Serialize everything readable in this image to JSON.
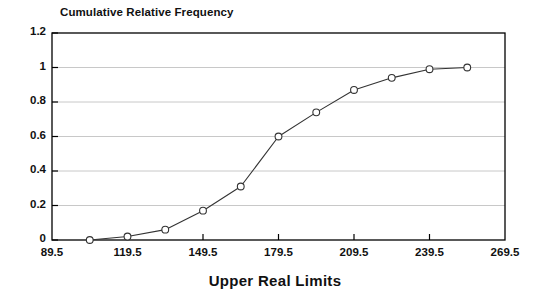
{
  "chart_data": {
    "type": "line",
    "title": "Cumulative Relative Frequency",
    "subtitle": "",
    "xlabel": "Upper Real Limits",
    "ylabel": "",
    "xlim": [
      89.5,
      269.5
    ],
    "ylim": [
      0,
      1.2
    ],
    "xticks": [
      89.5,
      119.5,
      149.5,
      179.5,
      209.5,
      239.5,
      269.5
    ],
    "xtick_labels": [
      "89.5",
      "119.5",
      "149.5",
      "179.5",
      "209.5",
      "239.5",
      "269.5"
    ],
    "yticks": [
      0,
      0.2,
      0.4,
      0.6,
      0.8,
      1,
      1.2
    ],
    "ytick_labels": [
      "0",
      "0.2",
      "0.4",
      "0.6",
      "0.8",
      "1",
      "1.2"
    ],
    "grid": "horizontal",
    "legend": "none",
    "marker": "open-circle",
    "line_color": "#333333",
    "grid_color": "#c8c8c8",
    "axis_color": "#000000",
    "x": [
      104.5,
      119.5,
      134.5,
      149.5,
      164.5,
      179.5,
      194.5,
      209.5,
      224.5,
      239.5,
      254.5
    ],
    "values": [
      0.0,
      0.02,
      0.06,
      0.17,
      0.31,
      0.6,
      0.74,
      0.87,
      0.94,
      0.99,
      1.0
    ],
    "series": [
      {
        "name": "Cumulative Relative Frequency",
        "points": [
          {
            "x": 104.5,
            "y": 0.0
          },
          {
            "x": 119.5,
            "y": 0.02
          },
          {
            "x": 134.5,
            "y": 0.06
          },
          {
            "x": 149.5,
            "y": 0.17
          },
          {
            "x": 164.5,
            "y": 0.31
          },
          {
            "x": 179.5,
            "y": 0.6
          },
          {
            "x": 194.5,
            "y": 0.74
          },
          {
            "x": 209.5,
            "y": 0.87
          },
          {
            "x": 224.5,
            "y": 0.94
          },
          {
            "x": 239.5,
            "y": 0.99
          },
          {
            "x": 254.5,
            "y": 1.0
          }
        ]
      }
    ]
  }
}
